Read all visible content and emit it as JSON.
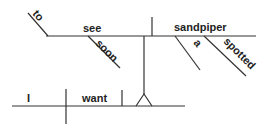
{
  "diagram": {
    "type": "sentence-diagram",
    "sentence": "I want to see a spotted sandpiper soon",
    "words": {
      "subject": "I",
      "verb": "want",
      "infinitive_marker": "to",
      "infinitive_verb": "see",
      "object": "sandpiper",
      "modifier_soon": "soon",
      "article": "a",
      "adjective": "spotted"
    },
    "colors": {
      "line": "#333333",
      "text": "#222222",
      "background": "#ffffff"
    }
  }
}
